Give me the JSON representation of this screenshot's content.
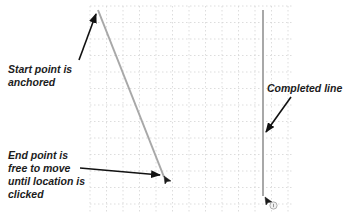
{
  "diagram": {
    "type": "line-drawing-illustration",
    "grid": {
      "visible": true,
      "style": "dotted",
      "color": "#d4d4d4",
      "x_start": 90,
      "y_start": 6,
      "x_end": 292,
      "y_end": 212,
      "spacing": 16.5
    },
    "lines": [
      {
        "id": "in-progress-line",
        "x1": 98,
        "y1": 10,
        "x2": 164,
        "y2": 177,
        "color": "#a8a8a8"
      },
      {
        "id": "completed-line",
        "x1": 263,
        "y1": 10,
        "x2": 263,
        "y2": 196,
        "color": "#a8a8a8"
      }
    ],
    "cursors": [
      {
        "id": "cursor-in-progress",
        "x": 164,
        "y": 176
      },
      {
        "id": "cursor-completed",
        "x": 265,
        "y": 197,
        "badge": "snap-indicator"
      }
    ],
    "callouts": [
      {
        "id": "start-callout",
        "text": "Start point is\nanchored",
        "arrow": {
          "x1": 79,
          "y1": 60,
          "x2": 96,
          "y2": 14
        }
      },
      {
        "id": "end-callout",
        "text": "End point is\nfree to move\nuntil location is\nclicked",
        "arrow": {
          "x1": 80,
          "y1": 168,
          "x2": 160,
          "y2": 175
        }
      },
      {
        "id": "completed-callout",
        "text": "Completed line",
        "arrow": {
          "x1": 291,
          "y1": 97,
          "x2": 266,
          "y2": 132
        }
      }
    ],
    "colors": {
      "background": "#ffffff",
      "text": "#1c1c1c",
      "arrow": "#111111",
      "line": "#a8a8a8",
      "grid": "#d4d4d4"
    }
  },
  "labels": {
    "start": "Start point is\nanchored",
    "end": "End point is\nfree to move\nuntil location is\nclicked",
    "completed": "Completed line"
  }
}
